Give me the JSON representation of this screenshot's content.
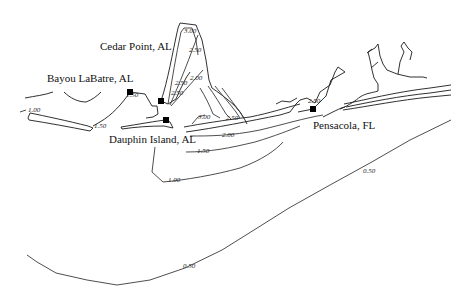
{
  "map": {
    "type": "contour map",
    "places": [
      {
        "name": "Cedar Point, AL",
        "x": 100,
        "y": 50
      },
      {
        "name": "Bayou LaBatre, AL",
        "x": 47,
        "y": 82
      },
      {
        "name": "Dauphin Island, AL",
        "x": 109,
        "y": 143
      },
      {
        "name": "Pensacola, FL",
        "x": 313,
        "y": 129
      }
    ],
    "stations": [
      {
        "name": "bayou-labatre-station",
        "x": 130,
        "y": 92
      },
      {
        "name": "cedar-point-station",
        "x": 161,
        "y": 101
      },
      {
        "name": "dauphin-island-station",
        "x": 166,
        "y": 120
      },
      {
        "name": "pensacola-station",
        "x": 313,
        "y": 109
      }
    ],
    "contour_labels": [
      {
        "text": "3.00",
        "x": 184,
        "y": 33
      },
      {
        "text": "2.50",
        "x": 189,
        "y": 52
      },
      {
        "text": "2.00",
        "x": 190,
        "y": 80
      },
      {
        "text": "2.50",
        "x": 175,
        "y": 85
      },
      {
        "text": "2.50",
        "x": 171,
        "y": 95
      },
      {
        "text": "1.00",
        "x": 28,
        "y": 112
      },
      {
        "text": "1.50",
        "x": 131,
        "y": 94
      },
      {
        "text": "1.50",
        "x": 94,
        "y": 128
      },
      {
        "text": "3.00",
        "x": 198,
        "y": 119
      },
      {
        "text": "2.50",
        "x": 226,
        "y": 120
      },
      {
        "text": "2.00",
        "x": 232,
        "y": 137
      },
      {
        "text": "1.50",
        "x": 197,
        "y": 153
      },
      {
        "text": "1.00",
        "x": 168,
        "y": 182
      },
      {
        "text": "2.50",
        "x": 303,
        "y": 103
      },
      {
        "text": "0.50",
        "x": 363,
        "y": 173
      },
      {
        "text": "0.50",
        "x": 183,
        "y": 268
      }
    ]
  }
}
